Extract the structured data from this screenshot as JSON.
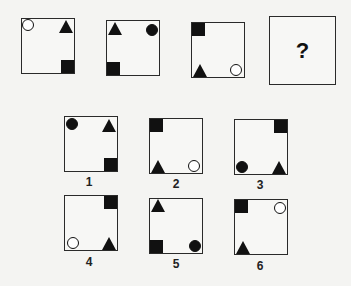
{
  "puzzle": {
    "sequence": [
      {
        "id": "seq-1",
        "shapes": {
          "tl": "open-circle",
          "tr": "triangle",
          "br": "square"
        }
      },
      {
        "id": "seq-2",
        "shapes": {
          "tl": "triangle",
          "tr": "filled-circle",
          "bl": "square"
        }
      },
      {
        "id": "seq-3",
        "shapes": {
          "tl": "square",
          "bl": "triangle",
          "br": "open-circle"
        }
      },
      {
        "id": "seq-4",
        "question_mark": "?"
      }
    ],
    "options": [
      {
        "label": "1",
        "shapes": {
          "tl": "filled-circle",
          "tr": "triangle",
          "br": "square"
        }
      },
      {
        "label": "2",
        "shapes": {
          "tl": "square",
          "bl": "triangle",
          "br": "open-circle"
        }
      },
      {
        "label": "3",
        "shapes": {
          "tr": "square",
          "bl": "filled-circle",
          "br": "triangle"
        }
      },
      {
        "label": "4",
        "shapes": {
          "tr": "square",
          "bl": "open-circle",
          "br": "triangle"
        }
      },
      {
        "label": "5",
        "shapes": {
          "tl": "triangle",
          "bl": "square",
          "br": "filled-circle"
        }
      },
      {
        "label": "6",
        "shapes": {
          "tl": "square",
          "tr": "open-circle",
          "bl": "triangle"
        }
      }
    ]
  }
}
